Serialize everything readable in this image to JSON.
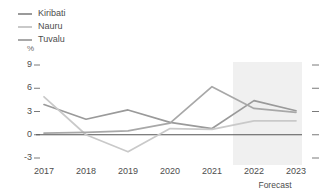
{
  "chart_data": {
    "type": "line",
    "title": "",
    "subtitle": "",
    "xlabel": "",
    "ylabel": "%",
    "unit": "%",
    "x": [
      "2017",
      "2018",
      "2019",
      "2020",
      "2021",
      "2022",
      "2023"
    ],
    "categories": [
      "2017",
      "2018",
      "2019",
      "2020",
      "2021",
      "2022",
      "2023"
    ],
    "yticks": [
      "9",
      "6",
      "3",
      "0",
      "-3"
    ],
    "ytick_values": [
      9,
      6,
      3,
      0,
      -3
    ],
    "ylim": [
      -3,
      9
    ],
    "grid": false,
    "legend_position": "top-left",
    "annotation": "Forecast",
    "forecast_start": "2022",
    "series": [
      {
        "name": "Kiribati",
        "color": "#9a9a9a",
        "values": [
          3.9,
          2.0,
          3.2,
          1.6,
          0.8,
          4.4,
          3.1
        ]
      },
      {
        "name": "Nauru",
        "color": "#c9c9c9",
        "values": [
          4.9,
          0.0,
          -2.2,
          0.8,
          0.7,
          1.8,
          1.8
        ]
      },
      {
        "name": "Tuvalu",
        "color": "#a8a8a8",
        "values": [
          0.2,
          0.3,
          0.5,
          1.5,
          6.2,
          3.4,
          2.9
        ]
      }
    ]
  },
  "legend": {
    "items": [
      {
        "label": "Kiribati",
        "color": "#9a9a9a"
      },
      {
        "label": "Nauru",
        "color": "#c9c9c9"
      },
      {
        "label": "Tuvalu",
        "color": "#a8a8a8"
      }
    ]
  },
  "axis": {
    "unit": "%",
    "y_labels": [
      "9",
      "6",
      "3",
      "0",
      "-3"
    ],
    "x_labels": [
      "2017",
      "2018",
      "2019",
      "2020",
      "2021",
      "2022",
      "2023"
    ]
  },
  "footnote": {
    "forecast": "Forecast"
  },
  "colors": {
    "zero_line": "#555555",
    "forecast_band": "#f0f0f0",
    "tick": "#7a7a7a",
    "text": "#4d4d4d"
  }
}
